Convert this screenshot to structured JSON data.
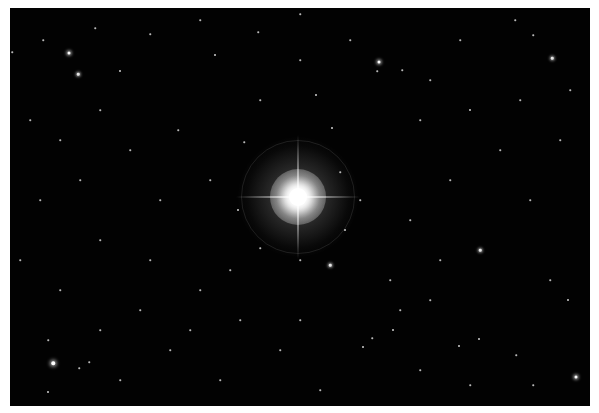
{
  "image": {
    "description": "Astronomical photograph of a bright star with diffraction spikes and halo against a dense black starfield",
    "background_color": "#020202",
    "border_color": "#ffffff"
  },
  "bright_star": {
    "x": 288,
    "y": 189,
    "color": "#ffffff"
  },
  "stars": [
    {
      "x": 69,
      "y": 53,
      "s": 3
    },
    {
      "x": 78,
      "y": 74,
      "s": 2.5
    },
    {
      "x": 120,
      "y": 71,
      "s": 2
    },
    {
      "x": 12,
      "y": 52,
      "s": 1.5
    },
    {
      "x": 43,
      "y": 40,
      "s": 1.5
    },
    {
      "x": 95,
      "y": 28,
      "s": 1.5
    },
    {
      "x": 150,
      "y": 34,
      "s": 1.5
    },
    {
      "x": 200,
      "y": 20,
      "s": 1.5
    },
    {
      "x": 379,
      "y": 62,
      "s": 3
    },
    {
      "x": 377,
      "y": 71,
      "s": 1.5
    },
    {
      "x": 402,
      "y": 70,
      "s": 1.5
    },
    {
      "x": 316,
      "y": 95,
      "s": 2
    },
    {
      "x": 552,
      "y": 58,
      "s": 2.5
    },
    {
      "x": 533,
      "y": 35,
      "s": 1.5
    },
    {
      "x": 515,
      "y": 20,
      "s": 1.5
    },
    {
      "x": 460,
      "y": 40,
      "s": 1.5
    },
    {
      "x": 258,
      "y": 32,
      "s": 1.5
    },
    {
      "x": 300,
      "y": 14,
      "s": 1.5
    },
    {
      "x": 420,
      "y": 120,
      "s": 1.5
    },
    {
      "x": 470,
      "y": 110,
      "s": 2
    },
    {
      "x": 500,
      "y": 150,
      "s": 1.5
    },
    {
      "x": 560,
      "y": 140,
      "s": 1.5
    },
    {
      "x": 530,
      "y": 200,
      "s": 1.5
    },
    {
      "x": 480,
      "y": 250,
      "s": 2.5
    },
    {
      "x": 550,
      "y": 280,
      "s": 1.5
    },
    {
      "x": 568,
      "y": 300,
      "s": 2
    },
    {
      "x": 430,
      "y": 300,
      "s": 1.5
    },
    {
      "x": 390,
      "y": 280,
      "s": 1.5
    },
    {
      "x": 215,
      "y": 55,
      "s": 2
    },
    {
      "x": 178,
      "y": 130,
      "s": 1.5
    },
    {
      "x": 130,
      "y": 150,
      "s": 1.5
    },
    {
      "x": 80,
      "y": 180,
      "s": 1.5
    },
    {
      "x": 40,
      "y": 200,
      "s": 1.5
    },
    {
      "x": 20,
      "y": 260,
      "s": 1.5
    },
    {
      "x": 60,
      "y": 290,
      "s": 1.5
    },
    {
      "x": 100,
      "y": 240,
      "s": 1.5
    },
    {
      "x": 150,
      "y": 260,
      "s": 1.5
    },
    {
      "x": 200,
      "y": 290,
      "s": 1.5
    },
    {
      "x": 240,
      "y": 320,
      "s": 1.5
    },
    {
      "x": 280,
      "y": 350,
      "s": 1.5
    },
    {
      "x": 53,
      "y": 363,
      "s": 3.5
    },
    {
      "x": 48,
      "y": 340,
      "s": 1.5
    },
    {
      "x": 79,
      "y": 368,
      "s": 1.5
    },
    {
      "x": 89,
      "y": 362,
      "s": 1.5
    },
    {
      "x": 48,
      "y": 392,
      "s": 2
    },
    {
      "x": 120,
      "y": 380,
      "s": 1.5
    },
    {
      "x": 170,
      "y": 350,
      "s": 1.5
    },
    {
      "x": 220,
      "y": 380,
      "s": 1.5
    },
    {
      "x": 363,
      "y": 347,
      "s": 2
    },
    {
      "x": 372,
      "y": 338,
      "s": 1.5
    },
    {
      "x": 393,
      "y": 330,
      "s": 2
    },
    {
      "x": 400,
      "y": 310,
      "s": 1.5
    },
    {
      "x": 459,
      "y": 346,
      "s": 2
    },
    {
      "x": 479,
      "y": 339,
      "s": 2
    },
    {
      "x": 516,
      "y": 355,
      "s": 1.5
    },
    {
      "x": 576,
      "y": 377,
      "s": 3
    },
    {
      "x": 533,
      "y": 385,
      "s": 1.5
    },
    {
      "x": 470,
      "y": 385,
      "s": 1.5
    },
    {
      "x": 420,
      "y": 370,
      "s": 1.5
    },
    {
      "x": 320,
      "y": 390,
      "s": 1.5
    },
    {
      "x": 238,
      "y": 210,
      "s": 2
    },
    {
      "x": 244,
      "y": 142,
      "s": 1.5
    },
    {
      "x": 332,
      "y": 128,
      "s": 2
    },
    {
      "x": 340,
      "y": 172,
      "s": 1.5
    },
    {
      "x": 345,
      "y": 230,
      "s": 2
    },
    {
      "x": 330,
      "y": 265,
      "s": 2.5
    },
    {
      "x": 300,
      "y": 260,
      "s": 1.5
    },
    {
      "x": 260,
      "y": 248,
      "s": 1.5
    },
    {
      "x": 230,
      "y": 270,
      "s": 1.5
    },
    {
      "x": 360,
      "y": 200,
      "s": 1.5
    },
    {
      "x": 210,
      "y": 180,
      "s": 1.5
    },
    {
      "x": 160,
      "y": 200,
      "s": 1.5
    },
    {
      "x": 260,
      "y": 100,
      "s": 1.5
    },
    {
      "x": 300,
      "y": 60,
      "s": 1.5
    },
    {
      "x": 350,
      "y": 40,
      "s": 1.5
    },
    {
      "x": 430,
      "y": 80,
      "s": 1.5
    },
    {
      "x": 450,
      "y": 180,
      "s": 1.5
    },
    {
      "x": 410,
      "y": 220,
      "s": 1.5
    },
    {
      "x": 440,
      "y": 260,
      "s": 1.5
    },
    {
      "x": 520,
      "y": 100,
      "s": 1.5
    },
    {
      "x": 570,
      "y": 90,
      "s": 1.5
    },
    {
      "x": 100,
      "y": 110,
      "s": 1.5
    },
    {
      "x": 30,
      "y": 120,
      "s": 1.5
    },
    {
      "x": 60,
      "y": 140,
      "s": 1.5
    },
    {
      "x": 140,
      "y": 310,
      "s": 1.5
    },
    {
      "x": 100,
      "y": 330,
      "s": 1.5
    },
    {
      "x": 190,
      "y": 330,
      "s": 1.5
    },
    {
      "x": 300,
      "y": 320,
      "s": 1.5
    }
  ]
}
